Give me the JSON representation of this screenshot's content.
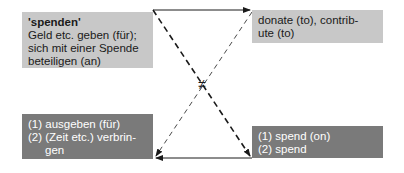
{
  "diagram": {
    "top_left": {
      "title": "'spenden'",
      "lines": [
        "Geld etc. geben (für);",
        "sich mit einer Spende",
        "beteiligen (an)"
      ]
    },
    "top_right": {
      "lines": [
        "donate (to), contrib-",
        "ute (to)"
      ]
    },
    "bottom_left": {
      "lines": [
        "(1) ausgeben (für)",
        "(2) (Zeit etc.) verbrin-",
        "gen"
      ]
    },
    "bottom_right": {
      "lines": [
        "(1) spend (on)",
        "(2) spend"
      ]
    },
    "center_symbol": "≠",
    "colors": {
      "light_box": "#c8c8c8",
      "dark_box": "#7a7a7a",
      "line": "#1a1a1a"
    }
  }
}
